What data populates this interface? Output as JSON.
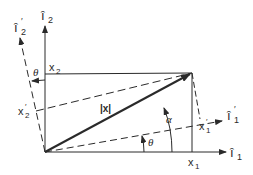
{
  "diagram": {
    "axes": {
      "i1": {
        "label": "î",
        "subscript": "1",
        "prime": ""
      },
      "i2": {
        "label": "î",
        "subscript": "2",
        "prime": ""
      },
      "i1_prime": {
        "label": "î",
        "subscript": "1",
        "prime": "′"
      },
      "i2_prime": {
        "label": "î",
        "subscript": "2",
        "prime": "′"
      }
    },
    "components": {
      "x1": {
        "label": "x",
        "subscript": "1",
        "prime": ""
      },
      "x2": {
        "label": "x",
        "subscript": "2",
        "prime": ""
      },
      "x1_prime": {
        "label": "x",
        "subscript": "1",
        "prime": "′"
      },
      "x2_prime": {
        "label": "x",
        "subscript": "2",
        "prime": "′"
      }
    },
    "vector": {
      "label": "|x|"
    },
    "angles": {
      "theta_top": "θ",
      "theta_bottom": "θ",
      "alpha": "α"
    },
    "colors": {
      "ink": "#2a2a2a"
    }
  }
}
